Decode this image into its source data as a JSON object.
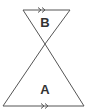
{
  "diagram": {
    "type": "similar-triangles",
    "colors": {
      "stroke": "#555555",
      "label": "#333333",
      "background": "#ffffff"
    },
    "triangles": [
      {
        "label": "B",
        "vertices": [
          [
            23,
            10
          ],
          [
            70,
            10
          ],
          [
            45,
            44
          ]
        ]
      },
      {
        "label": "A",
        "vertices": [
          [
            45,
            44
          ],
          [
            3,
            106
          ],
          [
            84,
            106
          ]
        ]
      }
    ],
    "parallel_marks": [
      {
        "edge": "top of B",
        "symbol": "double-arrow"
      },
      {
        "edge": "bottom of A",
        "symbol": "double-arrow"
      }
    ]
  }
}
